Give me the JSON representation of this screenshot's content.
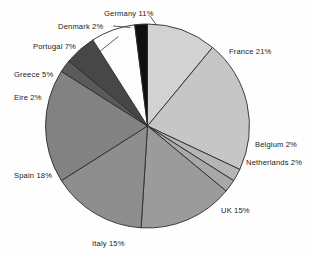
{
  "chart_data": {
    "type": "pie",
    "title": "",
    "subtitle": "",
    "xlabel": "",
    "ylabel": "",
    "legend_position": "none",
    "grid": false,
    "label_format": "{name} {value}%",
    "start_angle_deg": 0,
    "direction": "clockwise",
    "categories": [
      "Germany",
      "France",
      "Belgium",
      "Netherlands",
      "UK",
      "Italy",
      "Spain",
      "Eire",
      "Greece",
      "Portugal",
      "Denmark"
    ],
    "values": [
      11,
      21,
      2,
      2,
      15,
      15,
      18,
      2,
      5,
      7,
      2
    ],
    "colors": [
      "#d2d2d2",
      "#c6c6c6",
      "#b5b5b5",
      "#a8a8a8",
      "#9b9b9b",
      "#8e8e8e",
      "#828282",
      "#5a5a5a",
      "#474747",
      "#fdfdfd",
      "#101010"
    ],
    "slices": [
      {
        "name": "Germany",
        "value": 11,
        "label": "Germany 11%",
        "color": "#d2d2d2"
      },
      {
        "name": "France",
        "value": 21,
        "label": "France 21%",
        "color": "#c6c6c6"
      },
      {
        "name": "Belgium",
        "value": 2,
        "label": "Belgium 2%",
        "color": "#b5b5b5"
      },
      {
        "name": "Netherlands",
        "value": 2,
        "label": "Netherlands 2%",
        "color": "#a8a8a8"
      },
      {
        "name": "UK",
        "value": 15,
        "label": "UK 15%",
        "color": "#9b9b9b"
      },
      {
        "name": "Italy",
        "value": 15,
        "label": "Italy 15%",
        "color": "#8e8e8e"
      },
      {
        "name": "Spain",
        "value": 18,
        "label": "Spain 18%",
        "color": "#828282"
      },
      {
        "name": "Eire",
        "value": 2,
        "label": "Eire 2%",
        "color": "#5a5a5a"
      },
      {
        "name": "Greece",
        "value": 5,
        "label": "Greece 5%",
        "color": "#474747"
      },
      {
        "name": "Portugal",
        "value": 7,
        "label": "Portugal 7%",
        "color": "#fdfdfd"
      },
      {
        "name": "Denmark",
        "value": 2,
        "label": "Denmark 2%",
        "color": "#101010"
      }
    ]
  },
  "labels": {
    "germany": "Germany 11%",
    "france": "France 21%",
    "belgium": "Belgium 2%",
    "netherlands": "Netherlands 2%",
    "uk": "UK 15%",
    "italy": "Italy 15%",
    "spain": "Spain 18%",
    "eire": "Eire 2%",
    "greece": "Greece 5%",
    "portugal": "Portugal 7%",
    "denmark": "Denmark 2%"
  }
}
